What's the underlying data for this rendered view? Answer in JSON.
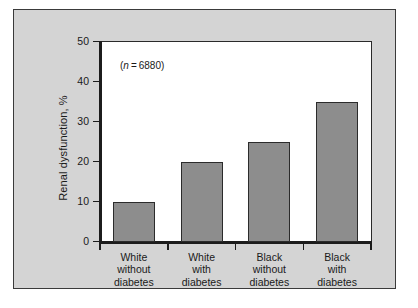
{
  "figure": {
    "background_color": "#d4d4d4",
    "plot_background_color": "#ffffff",
    "bar_color": "#8d8d8d",
    "bar_edge_color": "#2b2b2b",
    "axis_color": "#1c1c1c",
    "annotation": "(n = 6880)",
    "annotation_n_symbol": "n",
    "annotation_value": "6880"
  },
  "chart_data": {
    "type": "bar",
    "title": "",
    "xlabel": "",
    "ylabel": "Renal dysfunction, %",
    "ylim": [
      0,
      50
    ],
    "yticks": [
      0,
      10,
      20,
      30,
      40,
      50
    ],
    "ytick_labels": [
      "0",
      "10",
      "20",
      "30",
      "40",
      "50"
    ],
    "grid": false,
    "legend": null,
    "categories": [
      "White without diabetes",
      "White with diabetes",
      "Black without diabetes",
      "Black with diabetes"
    ],
    "category_lines": [
      [
        "White",
        "without",
        "diabetes"
      ],
      [
        "White",
        "with",
        "diabetes"
      ],
      [
        "Black",
        "without",
        "diabetes"
      ],
      [
        "Black",
        "with",
        "diabetes"
      ]
    ],
    "values": [
      10,
      20,
      25,
      35
    ],
    "annotations": [
      "(n = 6880)"
    ]
  }
}
